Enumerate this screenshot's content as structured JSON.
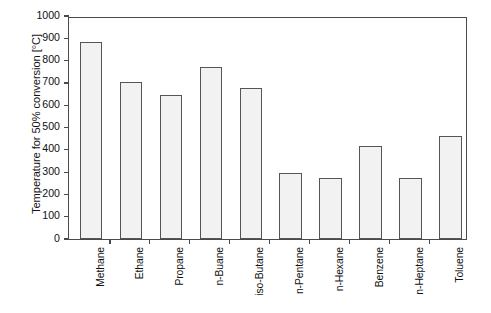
{
  "chart_data": {
    "type": "bar",
    "title": "",
    "subtitle": "",
    "xlabel": "",
    "ylabel": "Temperature for 50% conversion [°C]",
    "categories": [
      "Methane",
      "Ethane",
      "Propane",
      "n-Buane",
      "iso-Butane",
      "n-Pentane",
      "n-Hexane",
      "Benzene",
      "n-Heptane",
      "Toluene"
    ],
    "values": [
      885,
      705,
      648,
      770,
      678,
      295,
      275,
      415,
      272,
      462
    ],
    "ylim": [
      0,
      1000
    ],
    "yticks": [
      0,
      100,
      200,
      300,
      400,
      500,
      600,
      700,
      800,
      900,
      1000
    ],
    "ytick_labels": [
      "0",
      "100",
      "200",
      "300",
      "400",
      "500",
      "600",
      "700",
      "800",
      "900",
      "1000"
    ],
    "grid": false,
    "legend": false,
    "legend_position": "none",
    "bar_fill_color": "#f2f2f2",
    "bar_edge_color": "#555555",
    "axis_color": "#4a4a4a",
    "background_color": "#ffffff",
    "xtick_label_rotation": -90
  }
}
